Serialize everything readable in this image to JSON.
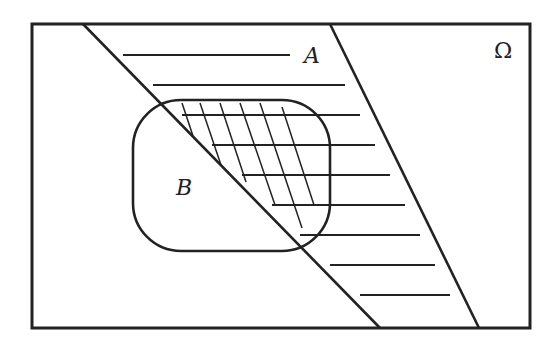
{
  "diagram": {
    "type": "venn",
    "universe_label": "Ω",
    "set_a_label": "A",
    "set_b_label": "B",
    "stroke_color": "#222222",
    "background": "#ffffff",
    "shading": {
      "A": "horizontal hatching",
      "A_and_B": "cross hatching"
    }
  }
}
